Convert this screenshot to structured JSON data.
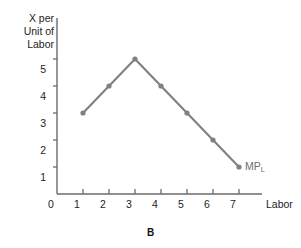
{
  "figure": {
    "caption": "B",
    "background_color": "#ffffff"
  },
  "chart_data": {
    "type": "line",
    "title": "",
    "subtitle": "",
    "xlabel": "Labor",
    "ylabel": "X per\nUnit of\nLabor",
    "ylabel_lines": [
      "X per",
      "Unit of",
      "Labor"
    ],
    "x": [
      1,
      2,
      3,
      4,
      5,
      6,
      7
    ],
    "values": [
      3,
      4,
      5,
      4,
      3,
      2,
      1
    ],
    "series": [
      {
        "name": "MP_L",
        "label_text": "MP",
        "label_subscript": "L",
        "values": [
          3,
          4,
          5,
          4,
          3,
          2,
          1
        ],
        "color": "#808080",
        "marker": "circle"
      }
    ],
    "x_tick_labels": [
      "0",
      "1",
      "2",
      "3",
      "4",
      "5",
      "6",
      "7"
    ],
    "x_tick_values": [
      0,
      1,
      2,
      3,
      4,
      5,
      6,
      7
    ],
    "y_tick_labels": [
      "1",
      "2",
      "3",
      "4",
      "5"
    ],
    "y_tick_values": [
      1,
      2,
      3,
      4,
      5
    ],
    "xlim": [
      0,
      8
    ],
    "ylim": [
      0,
      5.6
    ],
    "grid": false,
    "legend": "none",
    "annotations": [
      {
        "text": "MP",
        "subscript": "L",
        "x": 7,
        "y": 1,
        "color": "#6e6e6e"
      }
    ],
    "axis_color": "#6b6b6b",
    "text_color": "#1d1d1d"
  }
}
